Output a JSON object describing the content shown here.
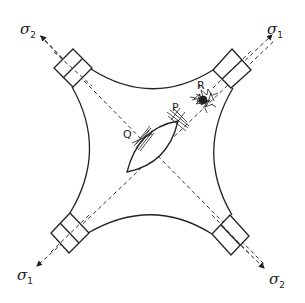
{
  "diagram": {
    "title": "",
    "stress_labels": {
      "top_left": {
        "symbol": "σ",
        "subscript": "2"
      },
      "top_right": {
        "symbol": "σ",
        "subscript": "1"
      },
      "bottom_left": {
        "symbol": "σ",
        "subscript": "1"
      },
      "bottom_right": {
        "symbol": "σ",
        "subscript": "2"
      }
    },
    "points": {
      "Q": "Q",
      "P": "P",
      "R": "R"
    },
    "colors": {
      "line": "#222222",
      "background": "#ffffff"
    }
  }
}
